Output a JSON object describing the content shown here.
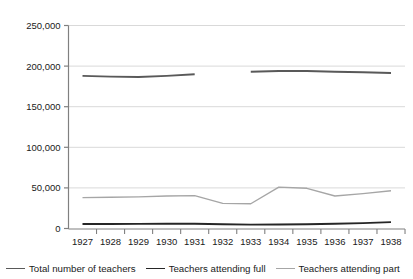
{
  "chart_data": {
    "type": "line",
    "title": "",
    "subtitle": "",
    "xlabel": "",
    "ylabel": "",
    "x": [
      1927,
      1928,
      1929,
      1930,
      1931,
      1932,
      1933,
      1934,
      1935,
      1936,
      1937,
      1938
    ],
    "categories": [
      "1927",
      "1928",
      "1929",
      "1930",
      "1931",
      "1932",
      "1933",
      "1934",
      "1935",
      "1936",
      "1937",
      "1938"
    ],
    "xtick_labels": [
      "1927",
      "1928",
      "1929",
      "1930",
      "1931",
      "1932",
      "1933",
      "1934",
      "1935",
      "1936",
      "1937",
      "1938"
    ],
    "ytick_labels": [
      "0",
      "50,000",
      "100,000",
      "150,000",
      "200,000",
      "250,000"
    ],
    "ytick_values": [
      0,
      50000,
      100000,
      150000,
      200000,
      250000
    ],
    "ylim": [
      0,
      250000
    ],
    "grid": "horizontal",
    "legend_position": "bottom",
    "series": [
      {
        "name": "Total number of teachers",
        "color": "#595959",
        "width": 1.9,
        "values": [
          188000,
          187000,
          186500,
          188000,
          190000,
          null,
          193000,
          194000,
          194000,
          193000,
          192500,
          191500
        ]
      },
      {
        "name": "Teachers attending full",
        "color": "#262626",
        "width": 1.9,
        "values": [
          5500,
          5600,
          5700,
          5800,
          5800,
          5200,
          4800,
          5000,
          5300,
          5800,
          6600,
          7800
        ]
      },
      {
        "name": "Teachers attending part",
        "color": "#a6a6a6",
        "width": 1.4,
        "values": [
          38000,
          38500,
          39000,
          40000,
          40500,
          31000,
          30500,
          51000,
          49500,
          40000,
          43000,
          46500
        ]
      }
    ]
  },
  "legend": {
    "items": [
      {
        "label": "Total number of teachers",
        "color": "#595959"
      },
      {
        "label": "Teachers attending full",
        "color": "#262626"
      },
      {
        "label": "Teachers attending part",
        "color": "#a6a6a6"
      }
    ]
  },
  "axes": {
    "y_axis_color": "#808080",
    "gridline_color": "#d9d9d9",
    "tick_color": "#808080"
  }
}
